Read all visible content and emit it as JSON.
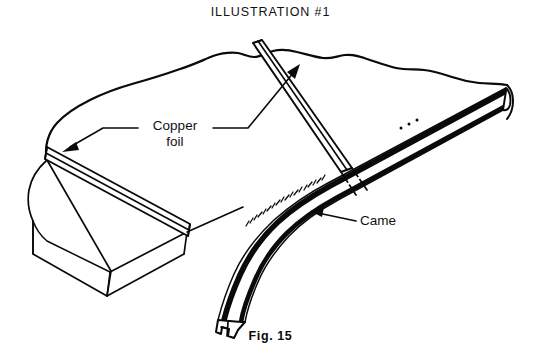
{
  "figure": {
    "title": "ILLUSTRATION #1",
    "caption": "Fig. 15",
    "ink_color": "#0a0a0a",
    "background_color": "#ffffff"
  },
  "labels": {
    "copper_foil": {
      "line1": "Copper",
      "line2": "foil"
    },
    "came": "Came"
  },
  "diagram_data": {
    "type": "line-art-illustration",
    "view": "oblique perspective",
    "components": [
      {
        "name": "glass-panel-upper",
        "description": "large irregular glass sheet with torn/freeform top edge"
      },
      {
        "name": "glass-panel-lower-left",
        "description": "glass slab showing thickness at lower left"
      },
      {
        "name": "copper-foil-seam-diagonal",
        "description": "foil strip running down the left edge of the panel"
      },
      {
        "name": "copper-foil-seam-vertical",
        "description": "foil strip running between two glass panels toward upper area"
      },
      {
        "name": "came-strip",
        "description": "H-channel lead came running along right edge and curving down to an exposed end profile"
      }
    ],
    "leader_lines": [
      {
        "label": "Copper foil",
        "points_to": "copper-foil-seam-diagonal"
      },
      {
        "label": "Copper foil",
        "points_to": "copper-foil-seam-vertical"
      },
      {
        "label": "Came",
        "points_to": "came-strip"
      }
    ]
  }
}
